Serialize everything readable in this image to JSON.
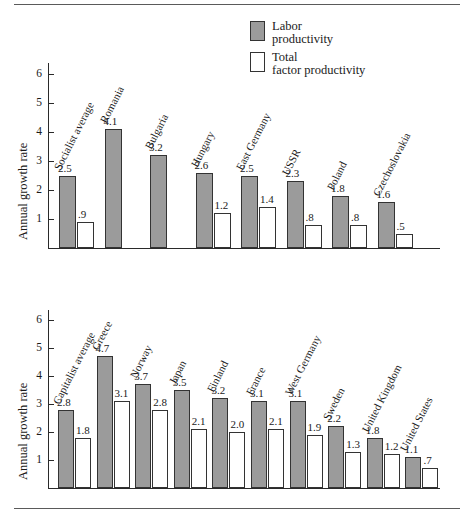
{
  "figure": {
    "rule_top": "horizontal-rule",
    "rule_bottom": "horizontal-rule"
  },
  "legend": {
    "position": "top-right",
    "items": [
      {
        "name": "labor",
        "line1": "Labor",
        "line2": "productivity",
        "color": "#9b9b9b"
      },
      {
        "name": "tfp",
        "line1": "Total",
        "line2": "factor productivity",
        "color": "#ffffff"
      }
    ]
  },
  "chart_data": [
    {
      "id": "socialist",
      "type": "bar",
      "title": "",
      "xlabel": "",
      "ylabel": "Annual growth rate",
      "ylim": [
        0,
        6.5
      ],
      "yticks": [
        1,
        2,
        3,
        4,
        5,
        6
      ],
      "ytick_labels": [
        "1",
        "2",
        "3",
        "4",
        "5",
        "6"
      ],
      "grid": false,
      "categories": [
        "Socialist average",
        "Romania",
        "Bulgaria",
        "Hungary",
        "East Germany",
        "USSR",
        "Poland",
        "Czechoslovakia"
      ],
      "series": [
        {
          "name": "Labor productivity",
          "color": "#9b9b9b",
          "values": [
            2.5,
            4.1,
            3.2,
            2.6,
            2.5,
            2.3,
            1.8,
            1.6
          ],
          "labels": [
            "2.5",
            "4.1",
            "3.2",
            "2.6",
            "2.5",
            "2.3",
            "1.8",
            "1.6"
          ]
        },
        {
          "name": "Total factor productivity",
          "color": "#ffffff",
          "values": [
            0.9,
            null,
            null,
            1.2,
            1.4,
            0.8,
            0.8,
            0.5
          ],
          "labels": [
            ".9",
            "",
            "",
            "1.2",
            "1.4",
            ".8",
            ".8",
            ".5"
          ]
        }
      ]
    },
    {
      "id": "capitalist",
      "type": "bar",
      "title": "",
      "xlabel": "",
      "ylabel": "Annual growth rate",
      "ylim": [
        0,
        6.5
      ],
      "yticks": [
        1,
        2,
        3,
        4,
        5,
        6
      ],
      "ytick_labels": [
        "1",
        "2",
        "3",
        "4",
        "5",
        "6"
      ],
      "grid": false,
      "categories": [
        "Capitalist average",
        "Greece",
        "Norway",
        "Japan",
        "Finland",
        "France",
        "West Germany",
        "Sweden",
        "United Kingdom",
        "United States"
      ],
      "series": [
        {
          "name": "Labor productivity",
          "color": "#9b9b9b",
          "values": [
            2.8,
            4.7,
            3.7,
            3.5,
            3.2,
            3.1,
            3.1,
            2.2,
            1.8,
            1.1
          ],
          "labels": [
            "2.8",
            "4.7",
            "3.7",
            "3.5",
            "3.2",
            "3.1",
            "3.1",
            "2.2",
            "1.8",
            "1.1"
          ]
        },
        {
          "name": "Total factor productivity",
          "color": "#ffffff",
          "values": [
            1.8,
            3.1,
            2.8,
            2.1,
            2.0,
            2.1,
            1.9,
            1.3,
            1.2,
            0.7
          ],
          "labels": [
            "1.8",
            "3.1",
            "2.8",
            "2.1",
            "2.0",
            "2.1",
            "1.9",
            "1.3",
            "1.2",
            ".7"
          ]
        }
      ]
    }
  ]
}
